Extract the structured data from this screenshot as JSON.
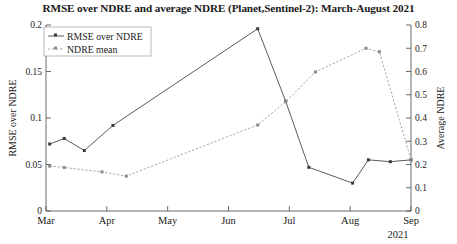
{
  "chart_data": {
    "type": "line",
    "title": "RMSE over NDRE and average NDRE (Planet,Sentinel-2): March-August 2021",
    "xlabel": "",
    "ylabel": "RMSE over NDRE",
    "y2label": "Average NDRE",
    "year_label": "2021",
    "grid": false,
    "legend_position": "top-left",
    "xlim": [
      0,
      6
    ],
    "ylim": [
      0,
      0.2
    ],
    "y2lim": [
      0,
      0.8
    ],
    "xtick_labels": [
      "Mar",
      "Apr",
      "May",
      "Jun",
      "Jul",
      "Aug",
      "Sep"
    ],
    "xtick_values": [
      0,
      1,
      2,
      3,
      4,
      5,
      6
    ],
    "ytick_labels": [
      "0",
      "0.05",
      "0.1",
      "0.15",
      "0.2"
    ],
    "ytick_values": [
      0,
      0.05,
      0.1,
      0.15,
      0.2
    ],
    "y2tick_labels": [
      "0",
      "0.1",
      "0.2",
      "0.3",
      "0.4",
      "0.5",
      "0.6",
      "0.7",
      "0.8"
    ],
    "y2tick_values": [
      0,
      0.1,
      0.2,
      0.3,
      0.4,
      0.5,
      0.6,
      0.7,
      0.8
    ],
    "series": [
      {
        "name": "RMSE over NDRE",
        "axis": "left",
        "style": "solid",
        "color": "#5b5b5b",
        "x": [
          0.06,
          0.3,
          0.63,
          1.1,
          3.48,
          3.94,
          4.32,
          5.04,
          5.3,
          5.66,
          6.0
        ],
        "values": [
          0.072,
          0.078,
          0.065,
          0.092,
          0.196,
          0.118,
          0.047,
          0.03,
          0.055,
          0.053,
          0.055
        ]
      },
      {
        "name": "NDRE mean",
        "axis": "right",
        "style": "dotted",
        "color": "#9b9b9b",
        "x": [
          0.06,
          0.3,
          0.92,
          1.32,
          3.48,
          3.94,
          4.43,
          5.26,
          5.48,
          6.0
        ],
        "values": [
          0.193,
          0.187,
          0.168,
          0.15,
          0.37,
          0.47,
          0.598,
          0.7,
          0.685,
          0.22
        ]
      }
    ],
    "legend_entries": [
      "RMSE over NDRE",
      "NDRE mean"
    ]
  }
}
